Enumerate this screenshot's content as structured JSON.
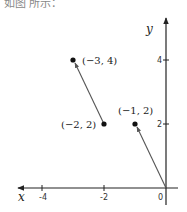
{
  "header": {
    "text": "如图 所示："
  },
  "axes": {
    "x_label": "x",
    "y_label": "y",
    "x_ticks": [
      "-4",
      "-2",
      "0"
    ],
    "y_ticks": [
      "4",
      "2"
    ]
  },
  "points": [
    {
      "label": "(−3, 4)",
      "x": -3,
      "y": 4
    },
    {
      "label": "(−2, 2)",
      "x": -2,
      "y": 2
    },
    {
      "label": "(−1, 2)",
      "x": -1,
      "y": 2
    }
  ],
  "vectors": [
    {
      "from": [
        -2,
        2
      ],
      "to": [
        -3,
        4
      ]
    },
    {
      "from": [
        0,
        0
      ],
      "to": [
        -1,
        2
      ]
    }
  ]
}
